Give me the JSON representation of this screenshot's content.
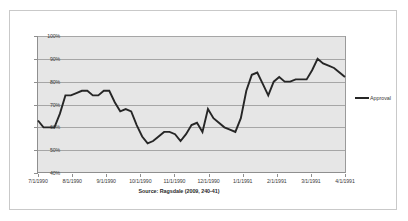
{
  "legend": {
    "entries": [
      {
        "label": "Approval",
        "color": "#262626"
      }
    ],
    "position": "right"
  },
  "caption": "Source: Ragsdale (2009, 240-41)",
  "colors": {
    "series_line": "#262626",
    "plot_background": "#e6e6e6",
    "gridline": "#a6a6a6",
    "axis": "#8f8f8f",
    "frame_border": "#c9c9c9",
    "tick_text": "#3a3a3a"
  },
  "chart_data": {
    "type": "line",
    "title": "",
    "subtitle": "",
    "xlabel": "",
    "ylabel": "",
    "ylim": [
      40,
      100
    ],
    "ytick_labels": [
      "40%",
      "50%",
      "60%",
      "70%",
      "80%",
      "90%",
      "100%"
    ],
    "ytick_values": [
      40,
      50,
      60,
      70,
      80,
      90,
      100
    ],
    "xtick_labels": [
      "7/1/1990",
      "8/1/1990",
      "9/1/1990",
      "10/1/1990",
      "11/1/1990",
      "12/1/1990",
      "1/1/1991",
      "2/1/1991",
      "3/1/1991",
      "4/1/1991"
    ],
    "grid": true,
    "legend_position": "right",
    "series": [
      {
        "name": "Approval",
        "color": "#262626",
        "values": [
          63,
          60,
          60,
          60,
          66,
          74,
          74,
          75,
          76,
          76,
          74,
          74,
          76,
          76,
          71,
          67,
          68,
          67,
          61,
          56,
          53,
          54,
          56,
          58,
          58,
          57,
          54,
          57,
          61,
          62,
          58,
          68,
          64,
          62,
          60,
          59,
          58,
          64,
          76,
          83,
          84,
          79,
          74,
          80,
          82,
          80,
          80,
          81,
          81,
          81,
          85,
          90,
          88,
          87,
          86,
          84,
          82
        ]
      }
    ]
  }
}
